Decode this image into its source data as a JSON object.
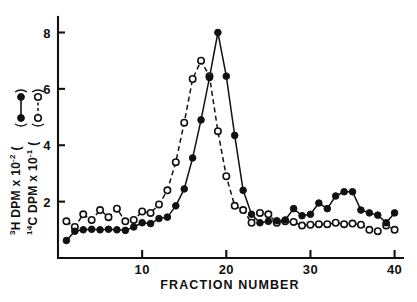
{
  "chart_data": {
    "type": "line",
    "title": "",
    "subtitle": "",
    "xlabel": "FRACTION NUMBER",
    "ylabel_primary": "3H DPM x 10-2 (●—●)",
    "ylabel_secondary": "14C DPM x 10-1 (○—○)",
    "ylabel_primary_parts": {
      "sup_front": "3",
      "main": "H DPM x 10",
      "sup_exp": "-2",
      "legend": "("
    },
    "ylabel_secondary_parts": {
      "sup_front": "14",
      "main": "C DPM x 10",
      "sup_exp": "-1",
      "legend": "("
    },
    "xlim": [
      0,
      41
    ],
    "ylim": [
      0,
      8.55
    ],
    "xticks": [
      10,
      20,
      30,
      40
    ],
    "xtick_labels": [
      "10",
      "20",
      "30",
      "40"
    ],
    "yticks": [
      2,
      4,
      6,
      8
    ],
    "ytick_labels": [
      "2",
      "4",
      "6",
      "8"
    ],
    "grid": false,
    "legend_position": "y-axis-label",
    "x": [
      1,
      2,
      3,
      4,
      5,
      6,
      7,
      8,
      9,
      10,
      11,
      12,
      13,
      14,
      15,
      16,
      17,
      18,
      19,
      20,
      21,
      22,
      23,
      24,
      25,
      26,
      27,
      28,
      29,
      30,
      31,
      32,
      33,
      34,
      35,
      36,
      37,
      38,
      39,
      40
    ],
    "series": [
      {
        "name": "3H DPM x 10-2",
        "marker": "filled-circle",
        "line": "solid",
        "color": "#111111",
        "values": [
          0.62,
          0.95,
          1.0,
          1.02,
          1.0,
          1.02,
          1.0,
          0.98,
          1.1,
          1.25,
          1.22,
          1.4,
          1.45,
          1.85,
          2.45,
          3.55,
          4.9,
          6.4,
          8.0,
          6.45,
          4.35,
          2.4,
          1.55,
          1.25,
          1.3,
          1.32,
          1.35,
          1.75,
          1.5,
          1.55,
          1.95,
          1.75,
          2.2,
          2.35,
          2.35,
          1.7,
          1.6,
          1.52,
          1.25,
          1.6
        ]
      },
      {
        "name": "14C DPM x 10-1",
        "marker": "open-circle",
        "line": "dashed",
        "color": "#111111",
        "values": [
          1.3,
          1.1,
          1.55,
          1.35,
          1.7,
          1.45,
          1.75,
          1.3,
          1.35,
          1.65,
          1.6,
          1.9,
          2.4,
          3.4,
          4.8,
          6.35,
          7.0,
          6.45,
          4.5,
          2.9,
          1.85,
          1.7,
          1.25,
          1.6,
          1.55,
          1.25,
          1.3,
          1.28,
          1.15,
          1.18,
          1.2,
          1.2,
          1.25,
          1.2,
          1.22,
          1.18,
          1.0,
          0.95,
          1.15,
          1.0
        ]
      }
    ]
  }
}
